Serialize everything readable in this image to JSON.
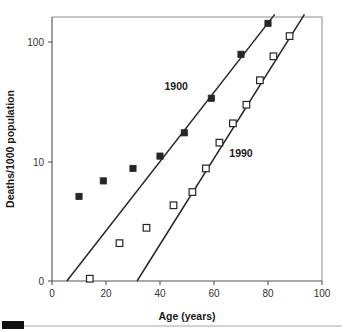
{
  "chart_data": {
    "type": "scatter",
    "title": "",
    "subtitle": "",
    "xlabel": "Age (years)",
    "ylabel": "Deaths/1000 population",
    "xlim": [
      0,
      100
    ],
    "xticks": [
      0,
      20,
      40,
      60,
      80,
      100
    ],
    "xtick_labels": [
      "0",
      "20",
      "40",
      "60",
      "80",
      "100"
    ],
    "yticks": [
      0,
      10,
      100
    ],
    "ytick_labels": [
      "0",
      "10",
      "100"
    ],
    "yscale": "log-like",
    "grid": false,
    "legend": "inline-annotations",
    "annotations": [
      {
        "text": "1900",
        "x": 46,
        "y": 40
      },
      {
        "text": "1990",
        "x": 70,
        "y": 11
      }
    ],
    "series": [
      {
        "name": "1900",
        "marker": "filled-square",
        "color": "#262626",
        "points": [
          {
            "x": 10,
            "y": 4.6
          },
          {
            "x": 19,
            "y": 6.6
          },
          {
            "x": 30,
            "y": 8.7
          },
          {
            "x": 40,
            "y": 11.2
          },
          {
            "x": 49,
            "y": 17.5
          },
          {
            "x": 59,
            "y": 34
          },
          {
            "x": 70,
            "y": 79
          },
          {
            "x": 80,
            "y": 143
          }
        ],
        "fit_line": {
          "x1": 5.5,
          "y1": 0,
          "x2": 82.5,
          "y2": 170
        }
      },
      {
        "name": "1990",
        "marker": "open-square",
        "color": "#262626",
        "points": [
          {
            "x": 14,
            "y": 0.05
          },
          {
            "x": 25,
            "y": 1.2
          },
          {
            "x": 35,
            "y": 2.0
          },
          {
            "x": 45,
            "y": 3.7
          },
          {
            "x": 52,
            "y": 5.1
          },
          {
            "x": 57,
            "y": 8.7
          },
          {
            "x": 62,
            "y": 14.5
          },
          {
            "x": 67,
            "y": 21
          },
          {
            "x": 72,
            "y": 30
          },
          {
            "x": 77,
            "y": 48
          },
          {
            "x": 82,
            "y": 76
          },
          {
            "x": 88,
            "y": 112
          }
        ],
        "fit_line": {
          "x1": 31.5,
          "y1": 0,
          "x2": 93.5,
          "y2": 170
        }
      }
    ]
  },
  "footer": {
    "rule_visible": true
  }
}
